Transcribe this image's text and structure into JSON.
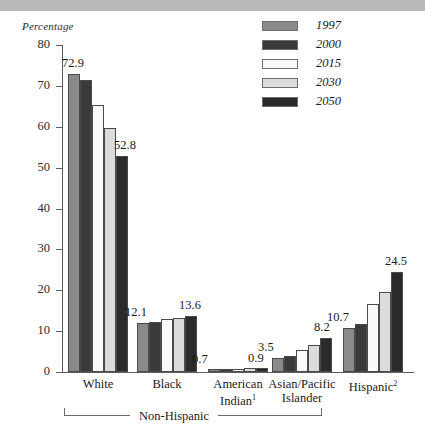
{
  "banner": {
    "present": true,
    "color": "#b9b9b9"
  },
  "chart_data": {
    "type": "bar",
    "title": "",
    "ylabel": "Percentage",
    "xlabel": "",
    "ylim": [
      0,
      80
    ],
    "yticks": [
      0,
      10,
      20,
      30,
      40,
      50,
      60,
      70,
      80
    ],
    "grid": false,
    "legend_position": "top-right",
    "categories": [
      "White",
      "Black",
      "American Indian",
      "Asian/Pacific Islander",
      "Hispanic"
    ],
    "category_footnotes": {
      "American Indian": "1",
      "Hispanic": "2"
    },
    "series": [
      {
        "name": "1997",
        "color": "#8a8a8a",
        "values": [
          72.9,
          12.1,
          0.7,
          3.5,
          10.7
        ]
      },
      {
        "name": "2000",
        "color": "#3a3a3a",
        "values": [
          71.4,
          12.3,
          0.7,
          4.0,
          11.8
        ]
      },
      {
        "name": "2015",
        "color": "#fafafa",
        "values": [
          65.4,
          12.9,
          0.8,
          5.4,
          16.6
        ]
      },
      {
        "name": "2030",
        "color": "#dcdcdc",
        "values": [
          59.6,
          13.3,
          0.9,
          6.5,
          19.6
        ]
      },
      {
        "name": "2050",
        "color": "#2a2a2a",
        "values": [
          52.8,
          13.6,
          0.9,
          8.2,
          24.5
        ]
      }
    ],
    "annotations": [
      {
        "text": "72.9",
        "category": "White",
        "series": "1997"
      },
      {
        "text": "52.8",
        "category": "White",
        "series": "2050"
      },
      {
        "text": "12.1",
        "category": "Black",
        "series": "1997"
      },
      {
        "text": "13.6",
        "category": "Black",
        "series": "2050"
      },
      {
        "text": "0.7",
        "category": "American Indian",
        "series": "1997"
      },
      {
        "text": "0.9",
        "category": "American Indian",
        "series": "2050"
      },
      {
        "text": "3.5",
        "category": "Asian/Pacific Islander",
        "series": "1997"
      },
      {
        "text": "8.2",
        "category": "Asian/Pacific Islander",
        "series": "2050"
      },
      {
        "text": "10.7",
        "category": "Hispanic",
        "series": "1997"
      },
      {
        "text": "24.5",
        "category": "Hispanic",
        "series": "2050"
      }
    ],
    "bracket": {
      "label": "Non-Hispanic",
      "spans": [
        "White",
        "Black",
        "American Indian",
        "Asian/Pacific Islander"
      ]
    }
  },
  "labels": {
    "group_0_line1": "White",
    "group_0_line2": "",
    "group_1_line1": "Black",
    "group_1_line2": "",
    "group_2_line1": "American",
    "group_2_line2": "Indian",
    "group_2_sup": "1",
    "group_3_line1": "Asian/Pacific",
    "group_3_line2": "Islander",
    "group_4_line1": "Hispanic",
    "group_4_sup": "2"
  }
}
